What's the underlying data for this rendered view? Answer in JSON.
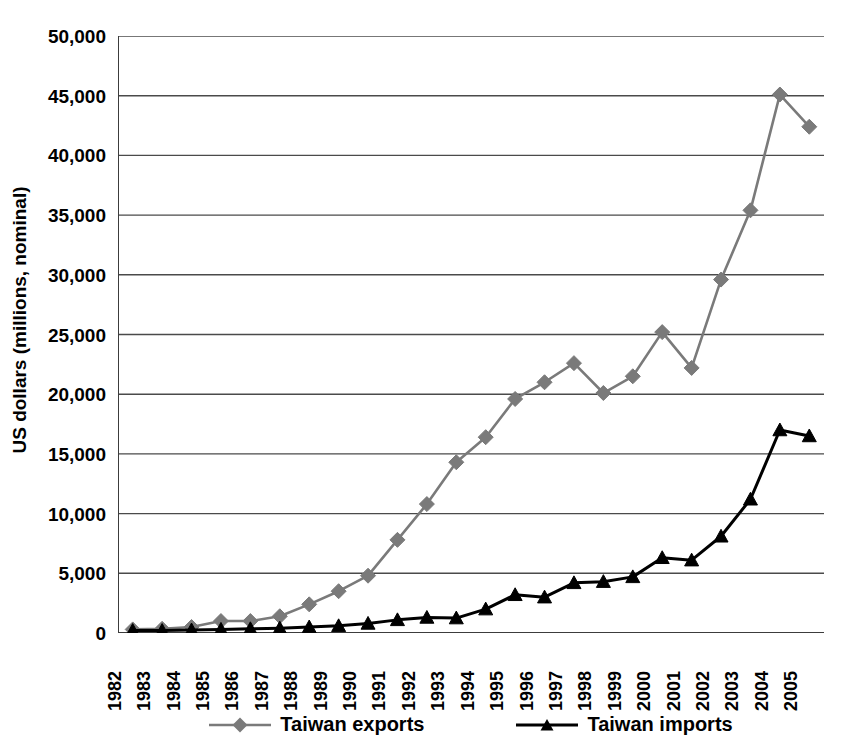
{
  "chart_data": {
    "type": "line",
    "title": "",
    "xlabel": "",
    "ylabel": "US dollars (millions, nominal)",
    "grid": true,
    "legend_position": "bottom",
    "ylim": [
      0,
      50000
    ],
    "yticks": [
      0,
      5000,
      10000,
      15000,
      20000,
      25000,
      30000,
      35000,
      40000,
      45000,
      50000
    ],
    "ytick_labels": [
      "0",
      "5,000",
      "10,000",
      "15,000",
      "20,000",
      "25,000",
      "30,000",
      "35,000",
      "40,000",
      "45,000",
      "50,000"
    ],
    "categories": [
      "1982",
      "1983",
      "1984",
      "1985",
      "1986",
      "1987",
      "1988",
      "1989",
      "1990",
      "1991",
      "1992",
      "1993",
      "1994",
      "1995",
      "1996",
      "1997",
      "1998",
      "1999",
      "2000",
      "2001",
      "2002",
      "2003",
      "2004",
      "2005"
    ],
    "series": [
      {
        "name": "Taiwan exports",
        "color": "#7a7a7a",
        "marker": "diamond",
        "values": [
          300,
          350,
          500,
          1000,
          1000,
          1400,
          2400,
          3500,
          4800,
          7800,
          10800,
          14300,
          16400,
          19600,
          21000,
          22600,
          20100,
          21500,
          25200,
          22200,
          29600,
          35400,
          45100,
          42400
        ]
      },
      {
        "name": "Taiwan imports",
        "color": "#000000",
        "marker": "triangle",
        "values": [
          200,
          200,
          250,
          300,
          350,
          400,
          500,
          600,
          800,
          1100,
          1300,
          1250,
          2000,
          3200,
          3000,
          4200,
          4300,
          4700,
          6300,
          6100,
          8100,
          11200,
          17000,
          16500
        ]
      }
    ]
  },
  "legend": {
    "items": [
      {
        "label": "Taiwan exports"
      },
      {
        "label": "Taiwan imports"
      }
    ]
  }
}
